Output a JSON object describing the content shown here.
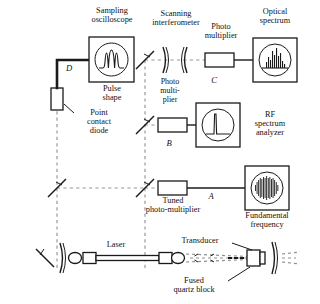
{
  "diagram": {
    "background_color": "#ffffff",
    "line_color": "#1a1a1a",
    "dashed_beam_color": "#8a8a8a"
  },
  "labels": {
    "sampling_oscilloscope": "Sampling\noscilloscope",
    "pulse_shape": "Pulse\nshape",
    "point_contact_diode": "Point\ncontact\ndiode",
    "scanning_interferometer": "Scanning\ninterferometer",
    "photo_multiplier_c": "Photo\nmultiplier",
    "optical_spectrum": "Optical\nspectrum",
    "photo_multiplier_b": "Photo\nmulti-\nplier",
    "rf_spectrum_analyzer": "RF\nspectrum\nanalyzer",
    "tuned_photo_multiplier": "Tuned\nphoto-multiplier",
    "fundamental_frequency": "Fundamental\nfrequency",
    "laser": "Laser",
    "transducer": "Transducer",
    "fused_quartz_block": "Fused\nquartz block"
  },
  "branch_labels": {
    "a": "A",
    "b": "B",
    "c": "C",
    "d": "D"
  },
  "displays": {
    "pulse_shape_trace": "three-peak-pulse-train-trace",
    "optical_spectrum_trace": "multi-mode-line-spectrum-trace",
    "rf_spectrum_trace": "single-sharp-peak-trace",
    "fundamental_frequency_trace": "dense-sinusoidal-burst-trace"
  },
  "icons": {
    "beamsplitter": "beamsplitter-icon",
    "mirror": "mirror-icon",
    "curved_mirror": "curved-mirror-icon",
    "diode": "point-contact-diode-icon",
    "laser_tube": "laser-tube-icon",
    "transducer_block": "transducer-icon"
  }
}
